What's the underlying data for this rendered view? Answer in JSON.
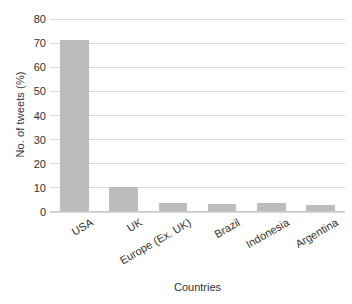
{
  "chart_data": {
    "type": "bar",
    "title": "",
    "xlabel": "Countries",
    "ylabel": "No. of tweets (%)",
    "categories": [
      "USA",
      "UK",
      "Europe (Ex. UK)",
      "Brazil",
      "Indonesia",
      "Argentina"
    ],
    "values": [
      71,
      10,
      3.2,
      2.9,
      3.5,
      2.5
    ],
    "ylim": [
      0,
      80
    ],
    "yticks": [
      0,
      10,
      20,
      30,
      40,
      50,
      60,
      70,
      80
    ],
    "ytick_labels": [
      "0",
      "10",
      "20",
      "30",
      "40",
      "50",
      "60",
      "70",
      "80"
    ],
    "grid": true,
    "legend": false,
    "bar_color": "#bdbdbd",
    "grid_color": "#d9d9d9",
    "text_color": "#333333",
    "background": "#ffffff"
  }
}
